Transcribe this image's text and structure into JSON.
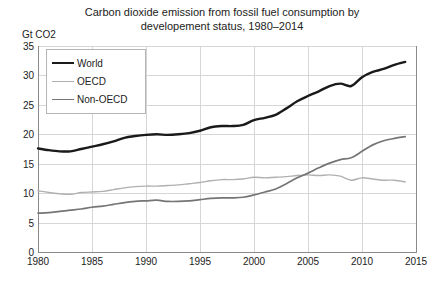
{
  "chart_data": {
    "type": "line",
    "title_line1": "Carbon dioxide emission from fossil fuel consumption by",
    "title_line2": "developement status, 1980–2014",
    "xlabel": "",
    "ylabel": "Gt CO2",
    "y_unit_label": "Gt CO2",
    "xlim": [
      1980,
      2015
    ],
    "ylim": [
      0,
      35
    ],
    "yticks": [
      0,
      5,
      10,
      15,
      20,
      25,
      30,
      35
    ],
    "ytick_labels": [
      "0",
      "5",
      "10",
      "15",
      "20",
      "25",
      "30",
      "35"
    ],
    "xticks": [
      1980,
      1985,
      1990,
      1995,
      2000,
      2005,
      2010,
      2015
    ],
    "xtick_labels": [
      "1980",
      "1985",
      "1990",
      "1995",
      "2000",
      "2005",
      "2010",
      "2015"
    ],
    "grid": true,
    "grid_color": "#d6d6d6",
    "legend_position": "upper left",
    "x": [
      1980,
      1981,
      1982,
      1983,
      1984,
      1985,
      1986,
      1987,
      1988,
      1989,
      1990,
      1991,
      1992,
      1993,
      1994,
      1995,
      1996,
      1997,
      1998,
      1999,
      2000,
      2001,
      2002,
      2003,
      2004,
      2005,
      2006,
      2007,
      2008,
      2009,
      2010,
      2011,
      2012,
      2013,
      2014
    ],
    "series": [
      {
        "name": "World",
        "color": "#1a1a1a",
        "width": 2.4,
        "values": [
          17.6,
          17.3,
          17.1,
          17.1,
          17.5,
          17.9,
          18.3,
          18.8,
          19.4,
          19.7,
          19.9,
          20.0,
          19.9,
          20.0,
          20.2,
          20.6,
          21.2,
          21.4,
          21.4,
          21.6,
          22.4,
          22.8,
          23.3,
          24.4,
          25.6,
          26.5,
          27.3,
          28.2,
          28.6,
          28.2,
          29.7,
          30.6,
          31.1,
          31.8,
          32.3
        ]
      },
      {
        "name": "OECD",
        "color": "#b0b0b0",
        "width": 1.4,
        "values": [
          10.4,
          10.1,
          9.9,
          9.8,
          10.1,
          10.2,
          10.3,
          10.6,
          10.9,
          11.1,
          11.2,
          11.2,
          11.3,
          11.4,
          11.6,
          11.8,
          12.1,
          12.3,
          12.3,
          12.4,
          12.7,
          12.6,
          12.7,
          12.8,
          13.0,
          13.1,
          13.0,
          13.1,
          12.9,
          12.2,
          12.6,
          12.4,
          12.2,
          12.2,
          11.9
        ]
      },
      {
        "name": "Non-OECD",
        "color": "#757575",
        "width": 1.7,
        "values": [
          6.6,
          6.7,
          6.9,
          7.1,
          7.3,
          7.6,
          7.8,
          8.1,
          8.4,
          8.6,
          8.7,
          8.8,
          8.6,
          8.6,
          8.7,
          8.9,
          9.1,
          9.2,
          9.2,
          9.3,
          9.7,
          10.2,
          10.7,
          11.6,
          12.6,
          13.4,
          14.3,
          15.1,
          15.7,
          16.0,
          17.1,
          18.2,
          18.9,
          19.3,
          19.6
        ]
      }
    ]
  },
  "legend": {
    "items": [
      {
        "label": "World"
      },
      {
        "label": "OECD"
      },
      {
        "label": "Non-OECD"
      }
    ]
  }
}
